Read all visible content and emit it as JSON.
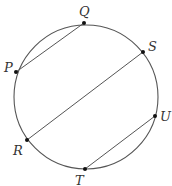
{
  "diagram": {
    "type": "circle-with-chords",
    "circle": {
      "cx": 86,
      "cy": 97,
      "r": 72,
      "stroke": "#555555"
    },
    "points": [
      {
        "name": "P",
        "x": 16,
        "y": 72,
        "label_x": 4,
        "label_y": 72
      },
      {
        "name": "Q",
        "x": 84,
        "y": 23,
        "label_x": 79,
        "label_y": 16
      },
      {
        "name": "S",
        "x": 143,
        "y": 52,
        "label_x": 149,
        "label_y": 50
      },
      {
        "name": "R",
        "x": 27,
        "y": 140,
        "label_x": 13,
        "label_y": 155
      },
      {
        "name": "T",
        "x": 85,
        "y": 169,
        "label_x": 75,
        "label_y": 186
      },
      {
        "name": "U",
        "x": 155,
        "y": 116,
        "label_x": 160,
        "label_y": 120
      }
    ],
    "chords": [
      {
        "from": "P",
        "to": "Q"
      },
      {
        "from": "R",
        "to": "S"
      },
      {
        "from": "T",
        "to": "U"
      }
    ],
    "labels": {
      "P": "P",
      "Q": "Q",
      "S": "S",
      "R": "R",
      "T": "T",
      "U": "U"
    }
  }
}
